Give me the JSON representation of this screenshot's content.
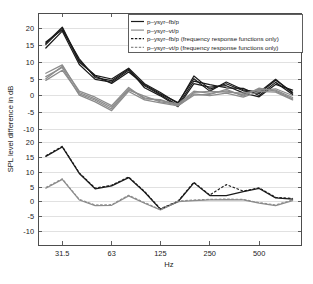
{
  "chart_data": {
    "type": "line",
    "title": "",
    "xlabel": "Hz",
    "ylabel": "SPL level difference in dB",
    "grid": true,
    "legend_position": "top-right",
    "x_scale": "log",
    "x_tick_labels": [
      "31.5",
      "63",
      "125",
      "250",
      "500"
    ],
    "x_tick_values": [
      31.5,
      63,
      125,
      250,
      500
    ],
    "xlim": [
      22.4,
      900
    ],
    "y_tick_labels_upper": [
      "20",
      "15",
      "10",
      "5",
      "0",
      "-5",
      "-10"
    ],
    "y_tick_values_upper": [
      20,
      15,
      10,
      5,
      0,
      -5,
      -10
    ],
    "y_tick_labels_lower": [
      "20",
      "15",
      "10",
      "5",
      "0",
      "-5",
      "-10"
    ],
    "y_tick_values_lower": [
      20,
      15,
      10,
      5,
      0,
      -5,
      -10
    ],
    "ylim_upper": [
      -14,
      24
    ],
    "ylim_lower": [
      -14,
      24
    ],
    "x": [
      25,
      31.5,
      40,
      50,
      63,
      80,
      100,
      125,
      160,
      200,
      250,
      315,
      400,
      500,
      630,
      800
    ],
    "legend": [
      {
        "label": "p–ysyr–fb/p",
        "color": "#1b1b1b",
        "style": "solid"
      },
      {
        "label": "p–ysyr–vt/p",
        "color": "#8c8c8c",
        "style": "solid"
      },
      {
        "label": "p–ysyr–fb/p (frequency response functions only)",
        "color": "#1b1b1b",
        "style": "dashed"
      },
      {
        "label": "p–ysyr–vt/p (frequency response functions only)",
        "color": "#8c8c8c",
        "style": "dashed"
      }
    ],
    "panels": [
      {
        "name": "upper",
        "series": [
          {
            "name": "p-ysyr-fb/p run 1",
            "color": "#1b1b1b",
            "style": "solid",
            "values": [
              15.2,
              20.1,
              10.0,
              6.1,
              5.0,
              8.2,
              3.6,
              1.0,
              -2.3,
              5.9,
              2.0,
              3.6,
              1.5,
              0.7,
              4.6,
              1.1
            ]
          },
          {
            "name": "p-ysyr-fb/p run 2",
            "color": "#1b1b1b",
            "style": "solid",
            "values": [
              14.2,
              19.2,
              9.3,
              4.9,
              4.1,
              7.6,
              3.0,
              0.3,
              -2.8,
              4.4,
              3.3,
              2.4,
              2.2,
              0.1,
              4.0,
              0.4
            ]
          },
          {
            "name": "p-ysyr-fb/p run 3",
            "color": "#1b1b1b",
            "style": "solid",
            "values": [
              16.0,
              19.6,
              11.0,
              5.4,
              4.5,
              8.0,
              2.4,
              0.0,
              -3.2,
              3.6,
              2.6,
              3.0,
              0.9,
              -0.3,
              3.4,
              1.7
            ]
          },
          {
            "name": "p-ysyr-fb/p run 4",
            "color": "#1b1b1b",
            "style": "solid",
            "values": [
              15.6,
              20.4,
              10.4,
              5.9,
              3.7,
              7.1,
              3.3,
              0.6,
              -2.0,
              5.1,
              1.4,
              4.1,
              1.8,
              1.1,
              4.9,
              0.8
            ]
          },
          {
            "name": "p-ysyr-vt/p run 1",
            "color": "#8c8c8c",
            "style": "solid",
            "values": [
              6.7,
              9.2,
              1.0,
              -0.9,
              -3.4,
              2.1,
              -0.6,
              -1.4,
              -2.4,
              1.4,
              0.7,
              1.5,
              0.3,
              2.0,
              1.7,
              -0.5
            ]
          },
          {
            "name": "p-ysyr-vt/p run 2",
            "color": "#8c8c8c",
            "style": "solid",
            "values": [
              5.7,
              8.4,
              0.2,
              -1.8,
              -4.4,
              1.3,
              -1.2,
              -2.1,
              -3.0,
              0.6,
              0.1,
              0.8,
              -0.4,
              1.3,
              1.1,
              -1.2
            ]
          },
          {
            "name": "p-ysyr-vt/p run 3",
            "color": "#8c8c8c",
            "style": "solid",
            "values": [
              4.6,
              7.6,
              0.6,
              -1.3,
              -3.9,
              1.7,
              -0.1,
              -1.8,
              -2.6,
              1.0,
              1.3,
              1.1,
              0.8,
              1.6,
              2.1,
              0.1
            ]
          },
          {
            "name": "p-ysyr-vt/p run 4",
            "color": "#8c8c8c",
            "style": "solid",
            "values": [
              5.1,
              8.8,
              1.4,
              -0.4,
              -2.9,
              2.5,
              -0.9,
              -1.1,
              -2.9,
              0.2,
              0.4,
              1.9,
              -0.1,
              2.3,
              1.4,
              -0.9
            ]
          }
        ]
      },
      {
        "name": "lower",
        "series": [
          {
            "name": "p-ysyr-fb/p",
            "color": "#1b1b1b",
            "style": "solid",
            "values": [
              15.4,
              18.6,
              9.6,
              4.4,
              5.4,
              8.2,
              3.3,
              -2.6,
              0.0,
              6.4,
              2.1,
              2.1,
              3.4,
              4.5,
              1.3,
              0.9
            ]
          },
          {
            "name": "p-ysyr-vt/p",
            "color": "#8c8c8c",
            "style": "solid",
            "values": [
              4.6,
              7.6,
              0.6,
              -1.3,
              -1.2,
              2.0,
              -0.5,
              -2.8,
              0.0,
              0.4,
              0.6,
              0.7,
              0.6,
              -0.5,
              -1.3,
              0.4
            ]
          },
          {
            "name": "p-ysyr-fb/p (frequency response functions only)",
            "color": "#1b1b1b",
            "style": "dashed",
            "values": [
              15.6,
              18.8,
              9.8,
              4.6,
              5.6,
              8.4,
              3.5,
              -2.4,
              0.2,
              6.6,
              2.3,
              5.8,
              3.6,
              4.7,
              1.5,
              1.1
            ]
          },
          {
            "name": "p-ysyr-vt/p (frequency response functions only)",
            "color": "#8c8c8c",
            "style": "dashed",
            "values": [
              4.8,
              7.8,
              0.8,
              -1.1,
              -1.0,
              2.2,
              -0.3,
              -2.6,
              0.2,
              0.6,
              0.8,
              0.9,
              0.8,
              -0.3,
              -1.1,
              0.6
            ]
          }
        ]
      }
    ]
  }
}
